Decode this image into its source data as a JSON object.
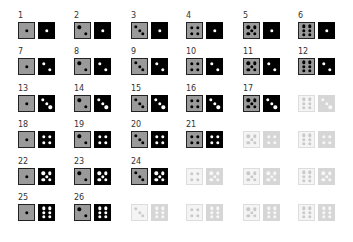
{
  "grid": {
    "columns": 6,
    "rows": 6,
    "column_x": [
      18,
      74,
      131,
      186,
      243,
      298
    ],
    "row_y": [
      11,
      47,
      84,
      120,
      157,
      193
    ],
    "colors": {
      "left_die_bg": "#9a9a9a",
      "left_die_pip": "#000000",
      "right_die_bg": "#000000",
      "right_die_pip": "#ffffff",
      "faded_left_bg": "#f4f4f4",
      "faded_right_bg": "#d6d6d6"
    },
    "cells": [
      {
        "label": "1",
        "left": 1,
        "right": 1,
        "active": true
      },
      {
        "label": "2",
        "left": 2,
        "right": 1,
        "active": true
      },
      {
        "label": "3",
        "left": 3,
        "right": 1,
        "active": true
      },
      {
        "label": "4",
        "left": 4,
        "right": 1,
        "active": true
      },
      {
        "label": "5",
        "left": 5,
        "right": 1,
        "active": true
      },
      {
        "label": "6",
        "left": 6,
        "right": 1,
        "active": true
      },
      {
        "label": "7",
        "left": 1,
        "right": 2,
        "active": true
      },
      {
        "label": "8",
        "left": 2,
        "right": 2,
        "active": true
      },
      {
        "label": "9",
        "left": 3,
        "right": 2,
        "active": true
      },
      {
        "label": "10",
        "left": 4,
        "right": 2,
        "active": true
      },
      {
        "label": "11",
        "left": 5,
        "right": 2,
        "active": true
      },
      {
        "label": "12",
        "left": 6,
        "right": 2,
        "active": true
      },
      {
        "label": "13",
        "left": 1,
        "right": 3,
        "active": true
      },
      {
        "label": "14",
        "left": 2,
        "right": 3,
        "active": true
      },
      {
        "label": "15",
        "left": 3,
        "right": 3,
        "active": true
      },
      {
        "label": "16",
        "left": 4,
        "right": 3,
        "active": true
      },
      {
        "label": "17",
        "left": 5,
        "right": 3,
        "active": true
      },
      {
        "label": "",
        "left": 6,
        "right": 3,
        "active": false
      },
      {
        "label": "18",
        "left": 1,
        "right": 4,
        "active": true
      },
      {
        "label": "19",
        "left": 2,
        "right": 4,
        "active": true
      },
      {
        "label": "20",
        "left": 3,
        "right": 4,
        "active": true
      },
      {
        "label": "21",
        "left": 4,
        "right": 4,
        "active": true
      },
      {
        "label": "",
        "left": 5,
        "right": 4,
        "active": false
      },
      {
        "label": "",
        "left": 6,
        "right": 4,
        "active": false
      },
      {
        "label": "22",
        "left": 1,
        "right": 5,
        "active": true
      },
      {
        "label": "23",
        "left": 2,
        "right": 5,
        "active": true
      },
      {
        "label": "24",
        "left": 3,
        "right": 5,
        "active": true
      },
      {
        "label": "",
        "left": 4,
        "right": 5,
        "active": false
      },
      {
        "label": "",
        "left": 5,
        "right": 5,
        "active": false
      },
      {
        "label": "",
        "left": 6,
        "right": 5,
        "active": false
      },
      {
        "label": "25",
        "left": 1,
        "right": 6,
        "active": true
      },
      {
        "label": "26",
        "left": 2,
        "right": 6,
        "active": true
      },
      {
        "label": "",
        "left": 3,
        "right": 6,
        "active": false
      },
      {
        "label": "",
        "left": 4,
        "right": 6,
        "active": false
      },
      {
        "label": "",
        "left": 5,
        "right": 6,
        "active": false
      },
      {
        "label": "",
        "left": 6,
        "right": 6,
        "active": false
      }
    ]
  }
}
